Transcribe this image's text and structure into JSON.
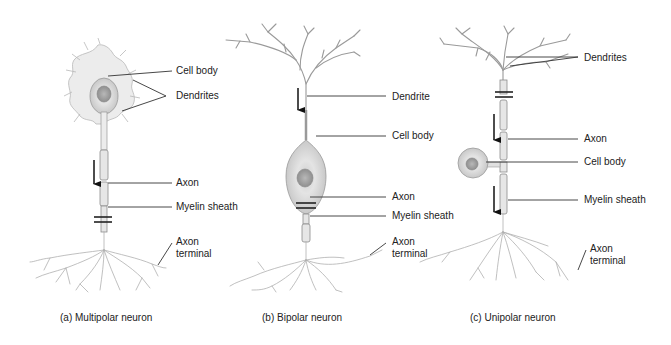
{
  "panels": [
    {
      "id": "a",
      "caption": "(a) Multipolar neuron",
      "labels": {
        "cell_body": "Cell body",
        "dendrites": "Dendrites",
        "axon": "Axon",
        "myelin_sheath": "Myelin sheath",
        "axon_terminal_1": "Axon",
        "axon_terminal_2": "terminal"
      }
    },
    {
      "id": "b",
      "caption": "(b) Bipolar neuron",
      "labels": {
        "dendrite": "Dendrite",
        "cell_body": "Cell body",
        "axon": "Axon",
        "myelin_sheath": "Myelin sheath",
        "axon_terminal_1": "Axon",
        "axon_terminal_2": "terminal"
      }
    },
    {
      "id": "c",
      "caption": "(c) Unipolar neuron",
      "labels": {
        "dendrites": "Dendrites",
        "axon": "Axon",
        "cell_body": "Cell body",
        "myelin_sheath": "Myelin sheath",
        "axon_terminal_1": "Axon",
        "axon_terminal_2": "terminal"
      }
    }
  ],
  "icons": {
    "signal_direction": "down-arrow-icon"
  }
}
